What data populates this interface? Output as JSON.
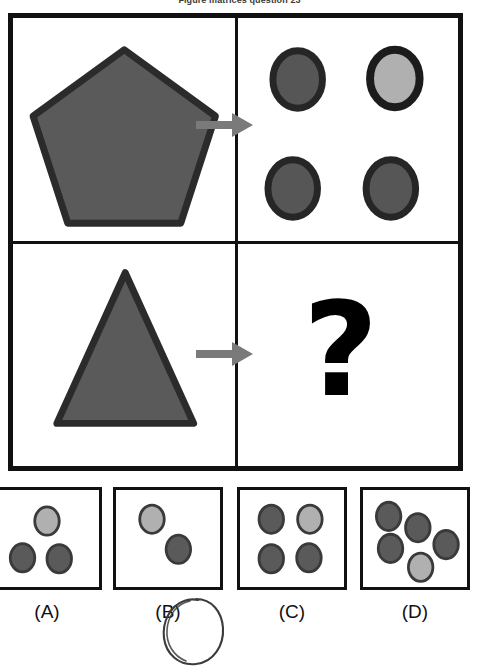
{
  "title": "Figure matrices question 23",
  "colors": {
    "frame": "#111111",
    "shape_fill_dark": "#5a5a5a",
    "shape_fill_light": "#b0b0b0",
    "shape_stroke": "#2b2b2b",
    "arrow": "#7a7a7a",
    "question_mark": "#000000",
    "background": "#ffffff"
  },
  "matrix": {
    "rows": 2,
    "columns": 2,
    "cells": {
      "top_left": {
        "shape": "pentagon",
        "fill": "dark",
        "label": "large dark gray pentagon"
      },
      "top_right": {
        "shape": "circle-group",
        "label": "four circles",
        "count": 4,
        "circles": [
          {
            "position": "top-left",
            "fill": "dark"
          },
          {
            "position": "top-right",
            "fill": "light"
          },
          {
            "position": "bottom-left",
            "fill": "dark"
          },
          {
            "position": "bottom-right",
            "fill": "dark"
          }
        ]
      },
      "bottom_left": {
        "shape": "triangle",
        "fill": "dark",
        "label": "large dark gray triangle"
      },
      "bottom_right": {
        "shape": "question-mark",
        "label": "?"
      }
    },
    "arrows": [
      {
        "name": "arrow-top-row",
        "direction": "right"
      },
      {
        "name": "arrow-bottom-row",
        "direction": "right"
      }
    ]
  },
  "options": [
    {
      "id": "A",
      "label": "(A)",
      "count": 3,
      "selected": false,
      "circles": [
        {
          "cx": 55,
          "cy": 33,
          "fill": "light"
        },
        {
          "cx": 29,
          "cy": 72,
          "fill": "dark"
        },
        {
          "cx": 68,
          "cy": 73,
          "fill": "dark"
        }
      ]
    },
    {
      "id": "B",
      "label": "(B)",
      "count": 2,
      "selected": true,
      "circles": [
        {
          "cx": 38,
          "cy": 31,
          "fill": "light"
        },
        {
          "cx": 66,
          "cy": 63,
          "fill": "dark"
        }
      ]
    },
    {
      "id": "C",
      "label": "(C)",
      "count": 4,
      "selected": false,
      "circles": [
        {
          "cx": 33,
          "cy": 31,
          "fill": "dark"
        },
        {
          "cx": 74,
          "cy": 31,
          "fill": "light"
        },
        {
          "cx": 33,
          "cy": 73,
          "fill": "dark"
        },
        {
          "cx": 73,
          "cy": 72,
          "fill": "dark"
        }
      ]
    },
    {
      "id": "D",
      "label": "(D)",
      "count": 5,
      "selected": false,
      "circles": [
        {
          "cx": 27,
          "cy": 28,
          "fill": "dark"
        },
        {
          "cx": 58,
          "cy": 40,
          "fill": "dark"
        },
        {
          "cx": 29,
          "cy": 62,
          "fill": "dark"
        },
        {
          "cx": 88,
          "cy": 58,
          "fill": "dark"
        },
        {
          "cx": 61,
          "cy": 82,
          "fill": "light"
        }
      ]
    }
  ],
  "annotation": {
    "type": "hand-drawn-oval",
    "target": "B",
    "name": "selected-answer-marker"
  }
}
